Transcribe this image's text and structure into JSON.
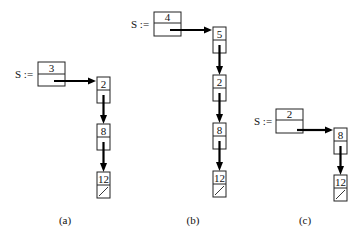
{
  "diagram": {
    "panels": [
      {
        "label": "(a)",
        "stack_var": "S :=",
        "stack_count": "3",
        "nodes": [
          "2",
          "8",
          "12"
        ]
      },
      {
        "label": "(b)",
        "stack_var": "S :=",
        "stack_count": "4",
        "nodes": [
          "5",
          "2",
          "8",
          "12"
        ]
      },
      {
        "label": "(c)",
        "stack_var": "S :=",
        "stack_count": "2",
        "nodes": [
          "8",
          "12"
        ]
      }
    ],
    "colors": {
      "stroke": "#222222",
      "arrow": "#000000",
      "background": "#ffffff"
    }
  }
}
